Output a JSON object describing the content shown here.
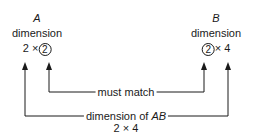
{
  "matrix_a": {
    "name": "A",
    "label": "dimension",
    "rows": "2",
    "times": "×",
    "cols": "2"
  },
  "matrix_b": {
    "name": "B",
    "label": "dimension",
    "rows": "2",
    "times": "×",
    "cols": "4"
  },
  "inner_connector": {
    "label": "must match"
  },
  "outer_connector": {
    "label": "dimension of",
    "label_italic": "AB",
    "result": "2 × 4"
  }
}
